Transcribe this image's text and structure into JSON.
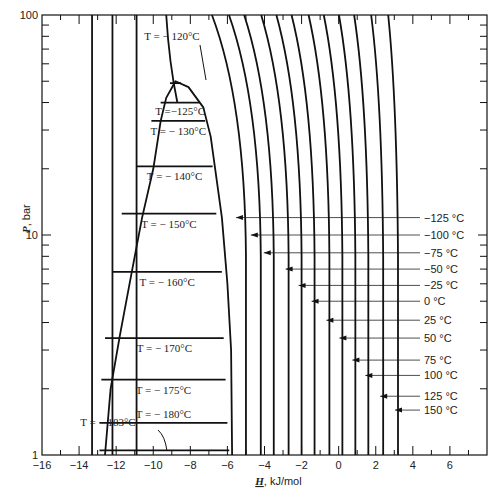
{
  "chart_data": {
    "type": "line",
    "title": "",
    "xlabel": "H, kJ/mol",
    "ylabel": "P, bar",
    "xlim": [
      -16,
      8
    ],
    "ylim": [
      1,
      100
    ],
    "yscale": "log",
    "x_ticks": [
      -16,
      -14,
      -12,
      -10,
      -8,
      -6,
      -4,
      -2,
      0,
      2,
      4,
      6
    ],
    "x_tick_labels": [
      "−16",
      "−14",
      "−12",
      "−10",
      "−8",
      "−6",
      "−4",
      "−2",
      "0",
      "2",
      "4",
      "6"
    ],
    "y_tick_labels": [
      {
        "value": 1,
        "label": "1"
      },
      {
        "value": 10,
        "label": "10"
      },
      {
        "value": 100,
        "label": "100"
      }
    ],
    "grid": false,
    "dome": {
      "description": "Two-phase (liquid-vapor) saturation dome",
      "critical_point": {
        "H": -8.8,
        "P": 50
      },
      "liquid_side": [
        {
          "H": -12.6,
          "P": 1
        },
        {
          "H": -12.3,
          "P": 2
        },
        {
          "H": -11.8,
          "P": 3.5
        },
        {
          "H": -11.2,
          "P": 6.5
        },
        {
          "H": -10.6,
          "P": 12
        },
        {
          "H": -10.0,
          "P": 20
        },
        {
          "H": -9.6,
          "P": 33
        },
        {
          "H": -9.3,
          "P": 42
        },
        {
          "H": -8.8,
          "P": 50
        }
      ],
      "vapor_side": [
        {
          "H": -8.8,
          "P": 50
        },
        {
          "H": -8.1,
          "P": 47
        },
        {
          "H": -7.3,
          "P": 38
        },
        {
          "H": -6.9,
          "P": 28
        },
        {
          "H": -6.3,
          "P": 12
        },
        {
          "H": -6.0,
          "P": 6
        },
        {
          "H": -5.8,
          "P": 3
        },
        {
          "H": -5.75,
          "P": 1
        }
      ]
    },
    "tie_lines": [
      {
        "label": "T = − 120°C",
        "T": -120,
        "P": 49,
        "H_left": -9.1,
        "H_right": -8.5
      },
      {
        "label": "T =−125°C",
        "T": -125,
        "P": 40,
        "H_left": -9.6,
        "H_right": -7.5
      },
      {
        "label": "T = − 130°C",
        "T": -130,
        "P": 33,
        "H_left": -10.1,
        "H_right": -7.2
      },
      {
        "label": "T = − 140°C",
        "T": -140,
        "P": 20.5,
        "H_left": -10.9,
        "H_right": -6.8
      },
      {
        "label": "T = − 150°C",
        "T": -150,
        "P": 12.5,
        "H_left": -11.7,
        "H_right": -6.6
      },
      {
        "label": "T = − 160°C",
        "T": -160,
        "P": 6.8,
        "H_left": -12.2,
        "H_right": -6.3
      },
      {
        "label": "T = − 170°C",
        "T": -170,
        "P": 3.4,
        "H_left": -12.6,
        "H_right": -6.2
      },
      {
        "label": "T = − 175°C",
        "T": -175,
        "P": 2.2,
        "H_left": -12.8,
        "H_right": -6.1
      },
      {
        "label": "T = − 180°C",
        "T": -180,
        "P": 1.4,
        "H_left": -12.9,
        "H_right": -6.0
      },
      {
        "label": "T = − 183°C",
        "T": -183,
        "P": 1.05,
        "H_left": -12.9,
        "H_right": -5.9
      }
    ],
    "isotherms_vapor": [
      {
        "label": "−125 °C",
        "T": -125,
        "H_at_1bar": -5.0,
        "arrow_P": 12.0
      },
      {
        "label": "−100 °C",
        "T": -100,
        "H_at_1bar": -4.2,
        "arrow_P": 10.0
      },
      {
        "label": "−75 °C",
        "T": -75,
        "H_at_1bar": -3.5,
        "arrow_P": 8.3
      },
      {
        "label": "−50 °C",
        "T": -50,
        "H_at_1bar": -2.7,
        "arrow_P": 7.0
      },
      {
        "label": "−25 °C",
        "T": -25,
        "H_at_1bar": -2.0,
        "arrow_P": 5.9
      },
      {
        "label": "0 °C",
        "T": 0,
        "H_at_1bar": -1.3,
        "arrow_P": 5.0
      },
      {
        "label": "25 °C",
        "T": 25,
        "H_at_1bar": -0.5,
        "arrow_P": 4.1
      },
      {
        "label": "50 °C",
        "T": 50,
        "H_at_1bar": 0.2,
        "arrow_P": 3.4
      },
      {
        "label": "75 °C",
        "T": 75,
        "H_at_1bar": 0.9,
        "arrow_P": 2.7
      },
      {
        "label": "100 °C",
        "T": 100,
        "H_at_1bar": 1.6,
        "arrow_P": 2.3
      },
      {
        "label": "125 °C",
        "T": 125,
        "H_at_1bar": 2.4,
        "arrow_P": 1.85
      },
      {
        "label": "150 °C",
        "T": 150,
        "H_at_1bar": 3.2,
        "arrow_P": 1.6
      }
    ],
    "isotherms_liquid": [
      {
        "description": "compressed-liquid vertical line",
        "H": -13.3
      },
      {
        "description": "compressed-liquid vertical line",
        "H": -12.2
      },
      {
        "description": "compressed-liquid vertical line",
        "H": -10.9
      },
      {
        "description": "curved line from top into dome",
        "H_top": -9.3,
        "H_bottom": -8.7,
        "P_bottom": 40
      }
    ],
    "legend": null
  }
}
